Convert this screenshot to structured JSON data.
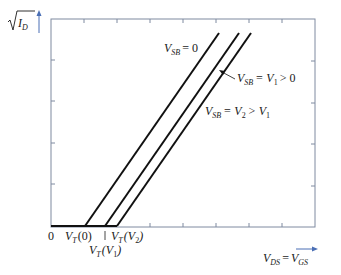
{
  "diagram": {
    "type": "mosfet-body-effect-sqrt-id-vs-vds",
    "y_axis": {
      "label_base": "I",
      "label_sub": "D",
      "radical": true
    },
    "x_axis": {
      "label_left": "V",
      "label_left_sub": "DS",
      "equals": "=",
      "label_right": "V",
      "label_right_sub": "GS"
    },
    "origin_label": "0",
    "threshold_labels": [
      {
        "base": "V",
        "sub": "T",
        "arg": "(0)"
      },
      {
        "base": "V",
        "sub": "T",
        "arg": "(V",
        "arg_sub": "1",
        "arg_close": ")"
      },
      {
        "base": "V",
        "sub": "T",
        "arg": "(V",
        "arg_sub": "2",
        "arg_close": ")"
      }
    ],
    "curves": [
      {
        "name": "vsb-0",
        "label_base": "V",
        "label_sub": "SB",
        "label_rest": "= 0",
        "x_start": 85,
        "x_end": 219
      },
      {
        "name": "vsb-v1",
        "label_base": "V",
        "label_sub": "SB",
        "label_mid": "= V",
        "label_mid_sub": "1",
        "label_rest": "> 0",
        "x_start": 105,
        "x_end": 239
      },
      {
        "name": "vsb-v2",
        "label_base": "V",
        "label_sub": "SB",
        "label_mid": "= V",
        "label_mid_sub": "2",
        "label_rest": "> V",
        "label_rest_sub": "1",
        "x_start": 117,
        "x_end": 251
      }
    ],
    "colors": {
      "frame": "#7f8aa0",
      "curve": "#111111",
      "arrow": "#4a6fb5",
      "text": "#1a1a1a"
    }
  }
}
